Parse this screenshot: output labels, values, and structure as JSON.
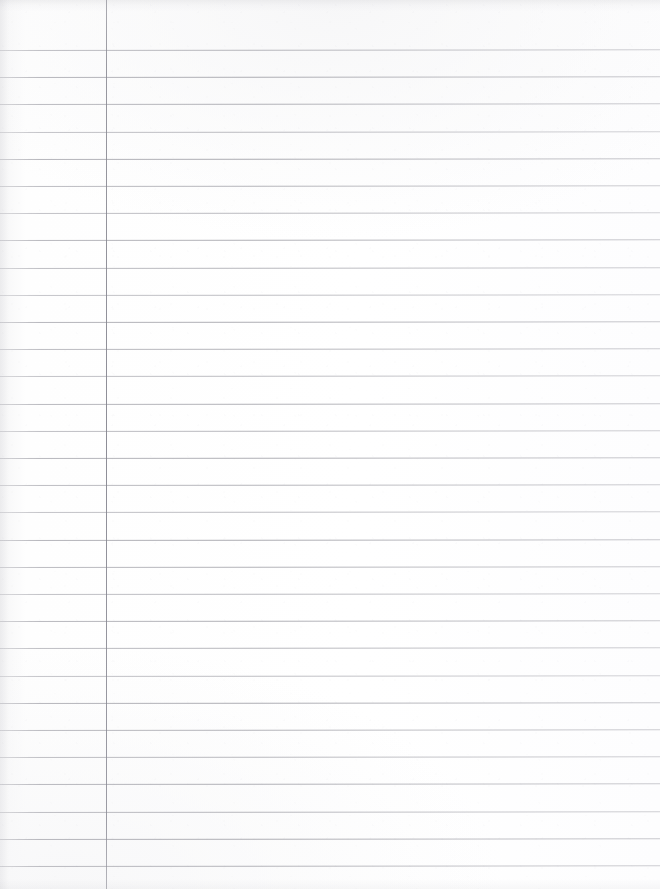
{
  "document": {
    "kind": "scanned-document",
    "subject": "blank-ruled-notebook-page",
    "orientation": "portrait",
    "page_width_px": 660,
    "page_height_px": 889,
    "visible_text": "",
    "handwriting_present": false,
    "printed_text_present": false
  },
  "paper": {
    "background_color": "#fdfdfd",
    "tint_color": "#f7f7f8",
    "edge_shadow_color": "#96969e",
    "noise_opacity": 0.4
  },
  "ruling": {
    "style": "college-ruled-single-margin",
    "horizontal": {
      "color": "#9a9aa2",
      "thickness_px": 1,
      "first_line_y": 50,
      "spacing_px": 27.2,
      "count": 31,
      "skew_deg": -0.06,
      "extends_full_width": true,
      "opacities": [
        0.62,
        0.7,
        0.66,
        0.58,
        0.72,
        0.64,
        0.6,
        0.69,
        0.63,
        0.57,
        0.71,
        0.65,
        0.59,
        0.68,
        0.62,
        0.7,
        0.64,
        0.58,
        0.72,
        0.66,
        0.6,
        0.69,
        0.63,
        0.57,
        0.71,
        0.65,
        0.61,
        0.68,
        0.62,
        0.7,
        0.64
      ]
    },
    "vertical_margin": {
      "color": "#88888f",
      "thickness_px": 1,
      "x": 106,
      "top_y": 0,
      "bottom_y": 889,
      "full_height": true
    }
  },
  "regions": {
    "left_margin_label": "left margin column",
    "writing_area_label": "ruled writing area"
  }
}
